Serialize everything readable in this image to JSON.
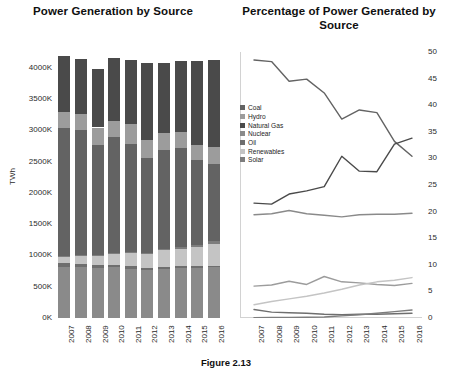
{
  "caption": "Figure 2.13",
  "colors": {
    "coal": "#636363",
    "hydro": "#9c9c9c",
    "natural_gas": "#4a4a4a",
    "nuclear": "#8a8a8a",
    "oil": "#6e6e6e",
    "renewables": "#c4c4c4",
    "solar": "#7d7d7d",
    "axis": "#2b2b2b",
    "grid": "#d2d2d2"
  },
  "bar_chart": {
    "title": "Power Generation by Source",
    "ylabel": "TWh",
    "chart_data": {
      "type": "bar",
      "title": "Power Generation by Source",
      "xlabel": "",
      "ylabel": "TWh",
      "ylim": [
        0,
        4250
      ],
      "yticks": [
        "0K",
        "500K",
        "1000K",
        "1500K",
        "2000K",
        "2500K",
        "3000K",
        "3500K",
        "4000K"
      ],
      "ytick_values": [
        0,
        500,
        1000,
        1500,
        2000,
        2500,
        3000,
        3500,
        4000
      ],
      "categories": [
        "2007",
        "2008",
        "2009",
        "2010",
        "2011",
        "2012",
        "2013",
        "2014",
        "2015",
        "2016"
      ],
      "stacked": true,
      "grid": false,
      "legend": "none",
      "series": [
        {
          "name": "Coal",
          "values": [
            2050,
            1990,
            1760,
            1850,
            1730,
            1520,
            1580,
            1570,
            1350,
            1230
          ]
        },
        {
          "name": "Hydro",
          "values": [
            250,
            255,
            275,
            260,
            320,
            280,
            270,
            260,
            250,
            270
          ]
        },
        {
          "name": "Natural Gas",
          "values": [
            900,
            890,
            930,
            1000,
            1020,
            1240,
            1130,
            1130,
            1340,
            1390
          ]
        },
        {
          "name": "Nuclear",
          "values": [
            810,
            810,
            800,
            810,
            790,
            770,
            790,
            800,
            800,
            810
          ]
        },
        {
          "name": "Oil",
          "values": [
            70,
            55,
            45,
            40,
            35,
            25,
            30,
            30,
            28,
            25
          ]
        },
        {
          "name": "Renewables",
          "values": [
            110,
            140,
            160,
            190,
            220,
            230,
            260,
            280,
            300,
            340
          ]
        },
        {
          "name": "Solar",
          "values": [
            2,
            3,
            4,
            5,
            8,
            15,
            22,
            30,
            42,
            56
          ]
        }
      ]
    }
  },
  "line_chart": {
    "title": "Percentage of Power Generated by Source",
    "legend_title": "",
    "chart_data": {
      "type": "line",
      "title": "Percentage of Power Generated by Source",
      "xlabel": "",
      "ylabel": "",
      "ylim": [
        0,
        50
      ],
      "yticks": [
        0,
        5,
        10,
        15,
        20,
        25,
        30,
        35,
        40,
        45,
        50
      ],
      "x": [
        "2007",
        "2008",
        "2009",
        "2010",
        "2011",
        "2012",
        "2013",
        "2014",
        "2015",
        "2016"
      ],
      "grid": false,
      "legend_position": "left-inside",
      "series": [
        {
          "name": "Coal",
          "values": [
            48.5,
            48.2,
            44.5,
            44.9,
            42.3,
            37.4,
            39.1,
            38.6,
            33.2,
            30.4
          ]
        },
        {
          "name": "Hydro",
          "values": [
            6.0,
            6.2,
            6.9,
            6.3,
            7.8,
            6.8,
            6.6,
            6.3,
            6.1,
            6.5
          ]
        },
        {
          "name": "Natural Gas",
          "values": [
            21.6,
            21.4,
            23.3,
            23.9,
            24.7,
            30.4,
            27.6,
            27.5,
            32.7,
            33.8
          ]
        },
        {
          "name": "Nuclear",
          "values": [
            19.4,
            19.6,
            20.2,
            19.6,
            19.3,
            19.0,
            19.4,
            19.5,
            19.5,
            19.7
          ]
        },
        {
          "name": "Oil",
          "values": [
            1.6,
            1.1,
            1.0,
            0.9,
            0.7,
            0.6,
            0.7,
            0.7,
            0.8,
            0.9
          ]
        },
        {
          "name": "Renewables",
          "values": [
            2.5,
            3.1,
            3.6,
            4.1,
            4.7,
            5.4,
            6.2,
            6.8,
            7.1,
            7.6
          ]
        },
        {
          "name": "Solar",
          "values": [
            0.05,
            0.08,
            0.1,
            0.15,
            0.2,
            0.4,
            0.6,
            0.9,
            1.2,
            1.5
          ]
        }
      ]
    },
    "legend": [
      {
        "label": "Coal",
        "color": "#636363"
      },
      {
        "label": "Hydro",
        "color": "#9c9c9c"
      },
      {
        "label": "Natural Gas",
        "color": "#4a4a4a"
      },
      {
        "label": "Nuclear",
        "color": "#8a8a8a"
      },
      {
        "label": "Oil",
        "color": "#6e6e6e"
      },
      {
        "label": "Renewables",
        "color": "#c4c4c4"
      },
      {
        "label": "Solar",
        "color": "#7d7d7d"
      }
    ]
  }
}
